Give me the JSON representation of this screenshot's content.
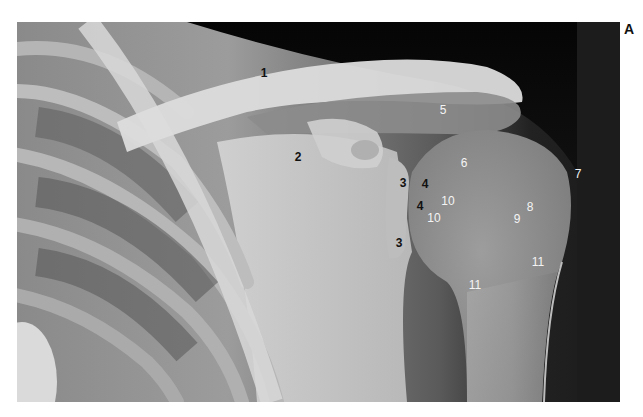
{
  "figure": {
    "panel_letter": "A",
    "labels": [
      {
        "id": "1",
        "text": "1",
        "x": 264,
        "y": 73,
        "tone": "dark"
      },
      {
        "id": "2",
        "text": "2",
        "x": 298,
        "y": 157,
        "tone": "dark"
      },
      {
        "id": "3a",
        "text": "3",
        "x": 403,
        "y": 183,
        "tone": "dark"
      },
      {
        "id": "4a",
        "text": "4",
        "x": 425,
        "y": 184,
        "tone": "dark"
      },
      {
        "id": "4b",
        "text": "4",
        "x": 420,
        "y": 206,
        "tone": "dark"
      },
      {
        "id": "3b",
        "text": "3",
        "x": 399,
        "y": 243,
        "tone": "dark"
      },
      {
        "id": "5",
        "text": "5",
        "x": 443,
        "y": 110,
        "tone": "light"
      },
      {
        "id": "6",
        "text": "6",
        "x": 464,
        "y": 163,
        "tone": "light"
      },
      {
        "id": "7",
        "text": "7",
        "x": 578,
        "y": 174,
        "tone": "light"
      },
      {
        "id": "8",
        "text": "8",
        "x": 530,
        "y": 207,
        "tone": "light"
      },
      {
        "id": "9",
        "text": "9",
        "x": 517,
        "y": 219,
        "tone": "light"
      },
      {
        "id": "10a",
        "text": "10",
        "x": 448,
        "y": 201,
        "tone": "light"
      },
      {
        "id": "10b",
        "text": "10",
        "x": 434,
        "y": 218,
        "tone": "light"
      },
      {
        "id": "11a",
        "text": "11",
        "x": 538,
        "y": 262,
        "tone": "light"
      },
      {
        "id": "11b",
        "text": "11",
        "x": 475,
        "y": 285,
        "tone": "light"
      }
    ]
  }
}
